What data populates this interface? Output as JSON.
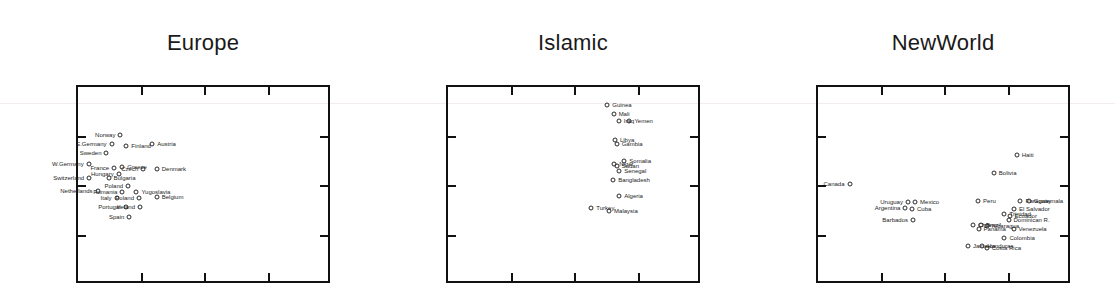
{
  "figure": {
    "width": 1115,
    "height": 303,
    "background": "#ffffff",
    "axis_color": "#111111",
    "point_color": "#2a2a2a",
    "label_color": "#1d1d1d",
    "type": "scatter-trellis",
    "panel_count": 3
  },
  "chart_data": {
    "type": "scatter",
    "title": "",
    "subtitle": "",
    "xlabel": "",
    "ylabel": "",
    "grid": false,
    "legend": "none",
    "axis_tick_labels": {
      "x": [],
      "y": []
    },
    "xlim": [
      0,
      1
    ],
    "ylim": [
      0,
      1
    ],
    "note": "Three-panel conditioned scatterplot; points labelled by country name. Axis tick marks drawn inward with no numeric tick labels.",
    "panels": [
      {
        "name": "Europe",
        "title": "Europe",
        "x_ticks": [
          0.25,
          0.5,
          0.75
        ],
        "y_ticks": [
          0.25,
          0.5,
          0.75
        ],
        "points": [
          {
            "label": "Norway",
            "x": 0.175,
            "y": 0.745,
            "side": "left"
          },
          {
            "label": "E.Germany",
            "x": 0.14,
            "y": 0.7,
            "side": "left"
          },
          {
            "label": "Finland",
            "x": 0.198,
            "y": 0.69,
            "side": "right"
          },
          {
            "label": "Austria",
            "x": 0.3,
            "y": 0.7,
            "side": "right"
          },
          {
            "label": "Sweden",
            "x": 0.12,
            "y": 0.655,
            "side": "left"
          },
          {
            "label": "W.Germany",
            "x": 0.05,
            "y": 0.6,
            "side": "left"
          },
          {
            "label": "France",
            "x": 0.15,
            "y": 0.582,
            "side": "left"
          },
          {
            "label": "Greece",
            "x": 0.182,
            "y": 0.585,
            "side": "right"
          },
          {
            "label": "Czech",
            "x": 0.265,
            "y": 0.578,
            "side": "left"
          },
          {
            "label": "Denmark",
            "x": 0.318,
            "y": 0.578,
            "side": "right"
          },
          {
            "label": "Hungary",
            "x": 0.168,
            "y": 0.548,
            "side": "left"
          },
          {
            "label": "Switzerland",
            "x": 0.052,
            "y": 0.53,
            "side": "left"
          },
          {
            "label": "Bulgaria",
            "x": 0.128,
            "y": 0.532,
            "side": "right"
          },
          {
            "label": "Poland",
            "x": 0.205,
            "y": 0.492,
            "side": "left"
          },
          {
            "label": "Netherlands",
            "x": 0.085,
            "y": 0.465,
            "side": "left"
          },
          {
            "label": "Romania",
            "x": 0.182,
            "y": 0.462,
            "side": "left"
          },
          {
            "label": "Yugoslavia",
            "x": 0.238,
            "y": 0.462,
            "side": "right"
          },
          {
            "label": "Italy",
            "x": 0.16,
            "y": 0.43,
            "side": "left"
          },
          {
            "label": "Poland",
            "x": 0.248,
            "y": 0.43,
            "side": "left"
          },
          {
            "label": "Belgium",
            "x": 0.318,
            "y": 0.432,
            "side": "right"
          },
          {
            "label": "Portugal",
            "x": 0.195,
            "y": 0.382,
            "side": "left"
          },
          {
            "label": "Ireland",
            "x": 0.252,
            "y": 0.382,
            "side": "left"
          },
          {
            "label": "Spain",
            "x": 0.21,
            "y": 0.332,
            "side": "left"
          }
        ]
      },
      {
        "name": "Islamic",
        "title": "Islamic",
        "x_ticks": [
          0.25,
          0.5,
          0.75
        ],
        "y_ticks": [
          0.25,
          0.5,
          0.75
        ],
        "points": [
          {
            "label": "Guinea",
            "x": 0.635,
            "y": 0.9,
            "side": "right"
          },
          {
            "label": "Mali",
            "x": 0.66,
            "y": 0.855,
            "side": "right"
          },
          {
            "label": "Iraq",
            "x": 0.68,
            "y": 0.818,
            "side": "right"
          },
          {
            "label": "Yemen",
            "x": 0.722,
            "y": 0.818,
            "side": "right"
          },
          {
            "label": "Libya",
            "x": 0.665,
            "y": 0.72,
            "side": "right"
          },
          {
            "label": "Gambia",
            "x": 0.672,
            "y": 0.7,
            "side": "right"
          },
          {
            "label": "Somalia",
            "x": 0.702,
            "y": 0.618,
            "side": "right"
          },
          {
            "label": "Niger",
            "x": 0.662,
            "y": 0.6,
            "side": "right"
          },
          {
            "label": "Sudan",
            "x": 0.672,
            "y": 0.592,
            "side": "right"
          },
          {
            "label": "Senegal",
            "x": 0.682,
            "y": 0.568,
            "side": "right"
          },
          {
            "label": "Bangladesh",
            "x": 0.658,
            "y": 0.522,
            "side": "right"
          },
          {
            "label": "Algeria",
            "x": 0.682,
            "y": 0.438,
            "side": "right"
          },
          {
            "label": "Turkey",
            "x": 0.572,
            "y": 0.378,
            "side": "right"
          },
          {
            "label": "Malaysia",
            "x": 0.642,
            "y": 0.362,
            "side": "right"
          }
        ]
      },
      {
        "name": "NewWorld",
        "title": "NewWorld",
        "x_ticks": [
          0.25,
          0.5,
          0.75
        ],
        "y_ticks": [
          0.25,
          0.5,
          0.75
        ],
        "points": [
          {
            "label": "Haiti",
            "x": 0.79,
            "y": 0.648,
            "side": "right"
          },
          {
            "label": "Bolivia",
            "x": 0.7,
            "y": 0.558,
            "side": "right"
          },
          {
            "label": "Canada",
            "x": 0.132,
            "y": 0.5,
            "side": "left"
          },
          {
            "label": "Peru",
            "x": 0.638,
            "y": 0.412,
            "side": "right"
          },
          {
            "label": "Paraguay",
            "x": 0.805,
            "y": 0.415,
            "side": "right"
          },
          {
            "label": "Guatemala",
            "x": 0.838,
            "y": 0.412,
            "side": "right"
          },
          {
            "label": "Uruguay",
            "x": 0.362,
            "y": 0.408,
            "side": "left"
          },
          {
            "label": "Mexico",
            "x": 0.39,
            "y": 0.408,
            "side": "right"
          },
          {
            "label": "Argentina",
            "x": 0.352,
            "y": 0.378,
            "side": "left"
          },
          {
            "label": "Cuba",
            "x": 0.378,
            "y": 0.372,
            "side": "right"
          },
          {
            "label": "El Salvador",
            "x": 0.78,
            "y": 0.372,
            "side": "right"
          },
          {
            "label": "Trinidad",
            "x": 0.742,
            "y": 0.348,
            "side": "right"
          },
          {
            "label": "Ecuador",
            "x": 0.762,
            "y": 0.34,
            "side": "right"
          },
          {
            "label": "Dominican R.",
            "x": 0.758,
            "y": 0.318,
            "side": "right"
          },
          {
            "label": "Barbados",
            "x": 0.382,
            "y": 0.318,
            "side": "left"
          },
          {
            "label": "Chile",
            "x": 0.618,
            "y": 0.295,
            "side": "right"
          },
          {
            "label": "Brazil",
            "x": 0.65,
            "y": 0.292,
            "side": "right"
          },
          {
            "label": "Nicaragua",
            "x": 0.672,
            "y": 0.288,
            "side": "right"
          },
          {
            "label": "Panama",
            "x": 0.64,
            "y": 0.272,
            "side": "right"
          },
          {
            "label": "Venezuela",
            "x": 0.778,
            "y": 0.272,
            "side": "right"
          },
          {
            "label": "Colombia",
            "x": 0.742,
            "y": 0.228,
            "side": "right"
          },
          {
            "label": "Jamaica",
            "x": 0.598,
            "y": 0.188,
            "side": "right"
          },
          {
            "label": "Honduras",
            "x": 0.655,
            "y": 0.188,
            "side": "right"
          },
          {
            "label": "Costa Rica",
            "x": 0.672,
            "y": 0.178,
            "side": "right"
          }
        ]
      }
    ]
  }
}
